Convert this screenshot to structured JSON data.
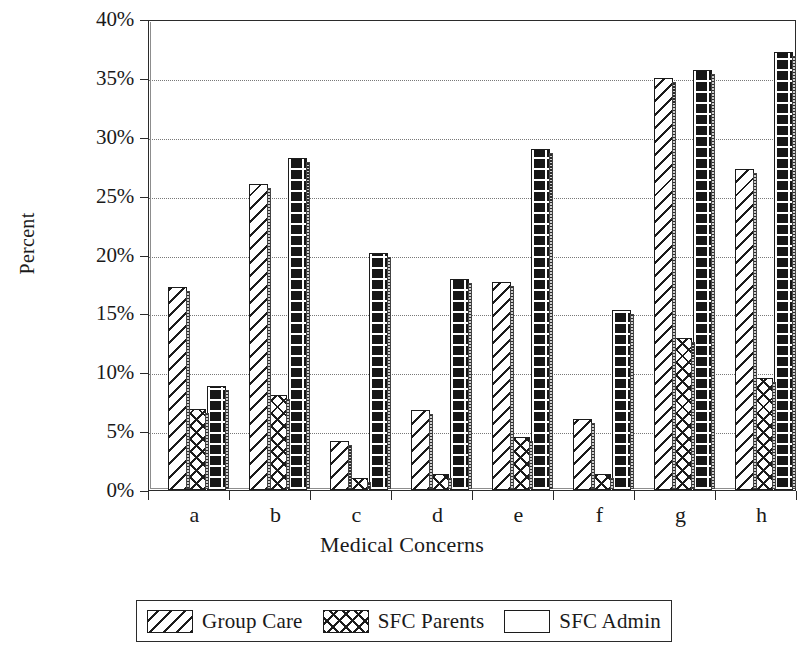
{
  "chart_data": {
    "type": "bar",
    "title": "",
    "xlabel": "Medical Concerns",
    "ylabel": "Percent",
    "categories": [
      "a",
      "b",
      "c",
      "d",
      "e",
      "f",
      "g",
      "h"
    ],
    "series": [
      {
        "name": "Group Care",
        "pattern": "diagonal-hatch",
        "values": [
          17.2,
          26.0,
          4.2,
          6.8,
          17.7,
          6.0,
          35.0,
          27.3
        ]
      },
      {
        "name": "SFC Parents",
        "pattern": "cross-hatch",
        "values": [
          6.9,
          8.1,
          1.0,
          1.4,
          4.5,
          1.4,
          12.9,
          9.5
        ]
      },
      {
        "name": "SFC Admin",
        "pattern": "brick",
        "values": [
          8.8,
          28.2,
          20.1,
          17.9,
          29.0,
          15.3,
          35.7,
          37.2
        ]
      }
    ],
    "ylim": [
      0,
      40
    ],
    "ytick_values": [
      0,
      5,
      10,
      15,
      20,
      25,
      30,
      35,
      40
    ],
    "ytick_labels": [
      "0%",
      "5%",
      "10%",
      "15%",
      "20%",
      "25%",
      "30%",
      "35%",
      "40%"
    ],
    "grid": true,
    "grid_style": "dotted-horizontal",
    "legend_position": "bottom",
    "colors": {
      "axis": "#2b2b2b",
      "grid": "#787878",
      "bar_outline": "#1c1c1c",
      "bar_fill": "#ffffff",
      "brick_fill": "#171717",
      "background": "#ffffff"
    }
  }
}
